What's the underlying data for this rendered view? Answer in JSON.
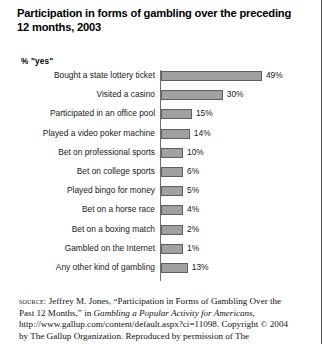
{
  "chart_data": {
    "type": "bar",
    "orientation": "horizontal",
    "title": "Participation in forms of gambling over the preceding 12 months, 2003",
    "axis_caption": "% \"yes\"",
    "xlabel": "",
    "ylabel": "",
    "xlim": [
      0,
      52
    ],
    "grid": false,
    "legend": null,
    "categories": [
      "Bought a state lottery ticket",
      "Visited a casino",
      "Participated in an office pool",
      "Played a video poker machine",
      "Bet on professional sports",
      "Bet on college sports",
      "Played bingo for money",
      "Bet on a horse race",
      "Bet on a boxing match",
      "Gambled on the Internet",
      "Any other kind of gambling"
    ],
    "values": [
      49,
      30,
      15,
      14,
      10,
      6,
      5,
      4,
      2,
      1,
      13
    ],
    "value_labels": [
      "49%",
      "30%",
      "15%",
      "14%",
      "10%",
      "6%",
      "5%",
      "4%",
      "2%",
      "1%",
      "13%"
    ],
    "bar_color": "#a0a0a0",
    "bar_border_color": "#5f5f5f",
    "axis_color": "#6e6e6e"
  },
  "source": {
    "keyword": "source:",
    "line_1": " Jeffrey M. Jones, “Participation in Forms of Gambling Over the Past 12 Months,” in ",
    "work_title": "Gambling a Popular Activity for Americans,",
    "line_2": " http://www.gallup.com/content/default.aspx?ci=11098. Copyright © 2004 by The Gallup Organization. Reproduced by permission of The"
  }
}
